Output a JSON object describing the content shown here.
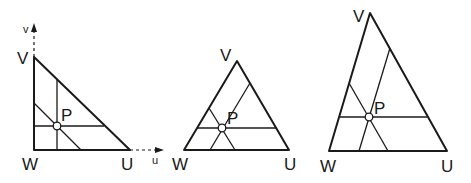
{
  "diagram": {
    "colors": {
      "line": "#1a1a1a",
      "background": "#ffffff"
    },
    "triangles": [
      {
        "id": "right-triangle",
        "vertices": {
          "W": "W",
          "U": "U",
          "V": "V"
        },
        "point_label": "P",
        "axes": {
          "u_label": "u",
          "v_label": "v"
        }
      },
      {
        "id": "equilateral-triangle",
        "vertices": {
          "W": "W",
          "U": "U",
          "V": "V"
        },
        "point_label": "P"
      },
      {
        "id": "scalene-triangle",
        "vertices": {
          "W": "W",
          "U": "U",
          "V": "V"
        },
        "point_label": "P"
      }
    ]
  }
}
